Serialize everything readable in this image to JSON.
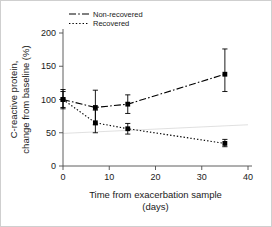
{
  "chart_data": {
    "type": "line",
    "title": "",
    "subtitle": "",
    "xlabel_line1": "Time from exacerbation sample",
    "xlabel_line2": "(days)",
    "ylabel_line1": "C-reactive protein,",
    "ylabel_line2": "change from baseline (%)",
    "xlim": [
      0,
      40
    ],
    "ylim": [
      0,
      200
    ],
    "xticks": [
      0,
      10,
      20,
      30,
      40
    ],
    "xticklabels": [
      "0",
      "10",
      "20",
      "30",
      "40"
    ],
    "yticks": [
      0,
      50,
      100,
      150,
      200
    ],
    "yticklabels": [
      "0",
      "50",
      "100",
      "150",
      "200"
    ],
    "grid": false,
    "legend_position": "top-left",
    "x": [
      0,
      7,
      14,
      35
    ],
    "series": [
      {
        "name": "Non-recovered",
        "linestyle": "dash-dot",
        "marker": "square",
        "color": "#000000",
        "values": [
          100,
          88,
          93,
          138
        ],
        "err_low": [
          88,
          62,
          79,
          112
        ],
        "err_high": [
          115,
          114,
          107,
          176
        ]
      },
      {
        "name": "Recovered",
        "linestyle": "dotted",
        "marker": "square",
        "color": "#000000",
        "values": [
          100,
          65,
          56,
          34
        ],
        "err_low": [
          86,
          50,
          48,
          29
        ],
        "err_high": [
          112,
          84,
          64,
          40
        ]
      }
    ],
    "reference_line": {
      "name": "faint-gray-trend-line",
      "color": "#d6d6d6",
      "x": [
        0,
        40
      ],
      "y": [
        49,
        62
      ]
    }
  }
}
